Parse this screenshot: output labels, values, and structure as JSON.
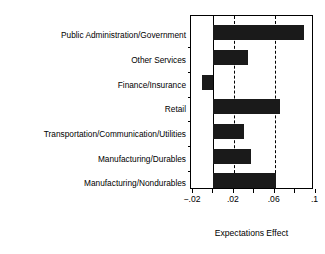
{
  "chart_data": {
    "type": "bar",
    "orientation": "horizontal",
    "title": "",
    "xlabel": "Expectations Effect",
    "ylabel": "",
    "categories": [
      "Public Administration/Government",
      "Other Services",
      "Finance/Insurance",
      "Retail",
      "Transportation/Communication/Utilities",
      "Manufacturing/Durables",
      "Manufacturing/Nondurables"
    ],
    "values": [
      0.089,
      0.034,
      -0.011,
      0.065,
      0.03,
      0.037,
      0.061
    ],
    "xlim": [
      -0.022,
      0.0985
    ],
    "xticks": [
      -0.02,
      0.0,
      0.02,
      0.04,
      0.06,
      0.08,
      0.1
    ],
    "xtick_labels": [
      "−.02",
      "",
      ".02",
      "",
      ".06",
      "",
      ".1"
    ],
    "gridlines_x": [
      0.02,
      0.06
    ],
    "grid": "dashed-vertical",
    "zero_line": 0.0,
    "legend": "none",
    "bar_color": "#1a1a1a",
    "axis_color": "#000000"
  },
  "axis": {
    "x_title": "Expectations Effect"
  }
}
